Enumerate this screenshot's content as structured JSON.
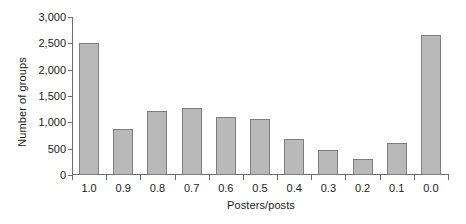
{
  "chart_data": {
    "type": "bar",
    "title": "",
    "xlabel": "Posters/posts",
    "ylabel": "Number of groups",
    "categories": [
      "1.0",
      "0.9",
      "0.8",
      "0.7",
      "0.6",
      "0.5",
      "0.4",
      "0.3",
      "0.2",
      "0.1",
      "0.0"
    ],
    "values": [
      2500,
      880,
      1220,
      1280,
      1100,
      1060,
      680,
      480,
      310,
      610,
      2650
    ],
    "ylim": [
      0,
      3000
    ],
    "ytick_values": [
      0,
      500,
      1000,
      1500,
      2000,
      2500,
      3000
    ],
    "ytick_labels": [
      "0",
      "500",
      "1,000",
      "1,500",
      "2,000",
      "2,500",
      "3,000"
    ],
    "grid": false,
    "legend": null,
    "series": [
      {
        "name": "Number of groups",
        "values": [
          2500,
          880,
          1220,
          1280,
          1100,
          1060,
          680,
          480,
          310,
          610,
          2650
        ]
      }
    ],
    "bar_fill_color": "#b9b9b9",
    "bar_border_color": "#7d7d7d",
    "axis_color": "#6e6e6e",
    "background_color": "#ffffff"
  }
}
